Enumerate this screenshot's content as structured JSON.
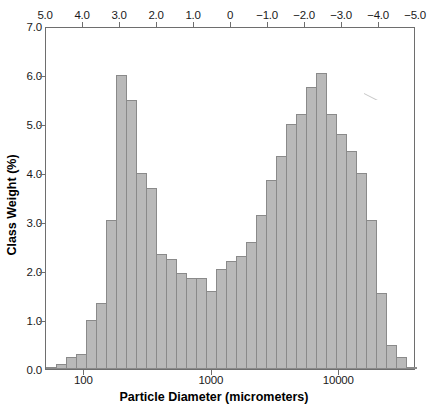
{
  "chart_data": {
    "type": "bar",
    "title": "",
    "xlabel": "Particle Diameter (micrometers)",
    "ylabel": "Class Weight (%)",
    "x_scale": "log",
    "xlim": [
      50,
      40000
    ],
    "ylim": [
      0.0,
      7.0
    ],
    "grid": false,
    "legend": null,
    "bar_color": "#b9b9b9",
    "bar_edge_color": "#8a8a8a",
    "axis_color": "#6e6e6e",
    "y_ticks": [
      "0.0",
      "1.0",
      "2.0",
      "3.0",
      "4.0",
      "5.0",
      "6.0",
      "7.0"
    ],
    "y_tick_values": [
      0.0,
      1.0,
      2.0,
      3.0,
      4.0,
      5.0,
      6.0,
      7.0
    ],
    "x_ticks": [
      "100",
      "1000",
      "10000"
    ],
    "x_tick_values": [
      100,
      1000,
      10000
    ],
    "secondary_axis": {
      "position": "top",
      "label": "",
      "ticks": [
        "5.0",
        "4.0",
        "3.0",
        "2.0",
        "1.0",
        "0",
        "-1.0",
        "-2.0",
        "-3.0",
        "-4.0",
        "-5.0"
      ],
      "tick_values": [
        5.0,
        4.0,
        3.0,
        2.0,
        1.0,
        0.0,
        -1.0,
        -2.0,
        -3.0,
        -4.0,
        -5.0
      ],
      "direction": "reversed"
    },
    "categories": [
      "4.70",
      "4.45",
      "4.20",
      "3.95",
      "3.70",
      "3.45",
      "3.20",
      "2.95",
      "2.70",
      "2.45",
      "2.20",
      "1.95",
      "1.70",
      "1.45",
      "1.20",
      "0.95",
      "0.70",
      "0.45",
      "0.20",
      "-0.05",
      "-0.30",
      "-0.55",
      "-0.80",
      "-1.05",
      "-1.30",
      "-1.55",
      "-1.80",
      "-2.05",
      "-2.30",
      "-2.55",
      "-2.80",
      "-3.05",
      "-3.30",
      "-3.55",
      "-3.80",
      "-4.05",
      "-4.30"
    ],
    "values": [
      0.05,
      0.1,
      0.25,
      0.3,
      1.0,
      1.35,
      3.05,
      6.0,
      5.5,
      4.0,
      3.7,
      2.35,
      2.25,
      1.95,
      1.85,
      1.85,
      1.6,
      2.05,
      2.2,
      2.3,
      2.6,
      3.15,
      3.85,
      4.35,
      5.0,
      5.2,
      5.75,
      6.05,
      5.2,
      4.8,
      4.45,
      4.0,
      3.05,
      1.55,
      0.5,
      0.25,
      0.05
    ]
  }
}
